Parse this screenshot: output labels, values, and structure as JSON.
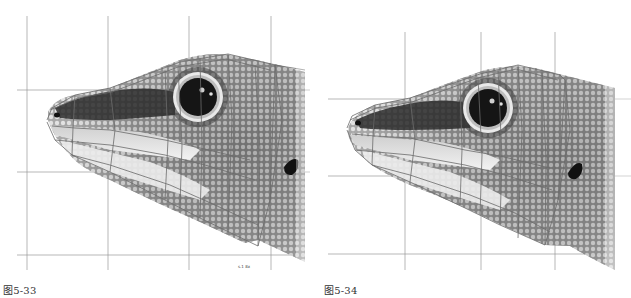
{
  "figures": [
    {
      "id": "left",
      "caption": "图5-33",
      "subject": "lizard head illustration with wireframe mesh overlay and reference grid",
      "scale_label": "s.1 8x"
    },
    {
      "id": "right",
      "caption": "图5-34",
      "subject": "lizard head illustration with denser wireframe mesh overlay and reference grid"
    }
  ],
  "colors": {
    "grid": "#9a9a9a",
    "mesh": "#6b6b6b",
    "skin_dark": "#2a2a2a",
    "skin_mid": "#8a8a8a",
    "skin_light": "#d8d8d8"
  }
}
